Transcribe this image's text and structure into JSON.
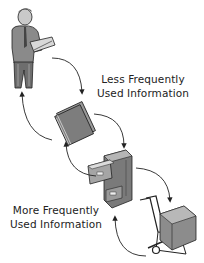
{
  "diagram": {
    "type": "cycle",
    "labels": {
      "less_frequent_line1": "Less Frequently",
      "less_frequent_line2": "Used Information",
      "more_frequent_line1": "More Frequently",
      "more_frequent_line2": "Used Information"
    },
    "nodes": [
      {
        "id": "person",
        "icon": "man-reading-book-icon"
      },
      {
        "id": "folder",
        "icon": "file-folder-icon"
      },
      {
        "id": "cabinet",
        "icon": "filing-cabinet-icon"
      },
      {
        "id": "hand-truck",
        "icon": "hand-truck-box-icon"
      }
    ],
    "colors": {
      "ink": "#222222",
      "gray_fill": "#8a8a8a",
      "light_gray": "#bdbdbd",
      "background": "#ffffff"
    }
  }
}
